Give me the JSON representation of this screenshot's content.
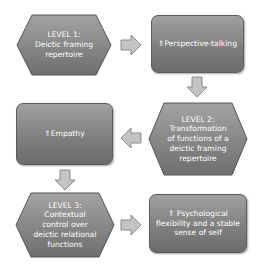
{
  "nodes": {
    "level1": {
      "line1": "LEVEL 1:",
      "line2": "Deictic framing",
      "line3": "repertoire"
    },
    "perspective": {
      "text": "⇑Perspective-talking"
    },
    "level2": {
      "line1": "LEVEL 2:",
      "line2": "Transformation",
      "line3": "of functions of a",
      "line4": "deictic framing",
      "line5": "repertoire"
    },
    "empathy": {
      "text": "⇑Empathy"
    },
    "level3": {
      "line1": "LEVEL 3:",
      "line2": "Contextual",
      "line3": "control over",
      "line4": "deictic relational",
      "line5": "functions"
    },
    "flexibility": {
      "line1": "⇑ Psychological",
      "line2": "flexibility and a stable",
      "line3": "sense of self"
    }
  },
  "colors": {
    "node_fill": "#858585",
    "node_border": "#555555",
    "arrow_fill": "#c4c4c4",
    "arrow_border": "#8a8a8a"
  }
}
